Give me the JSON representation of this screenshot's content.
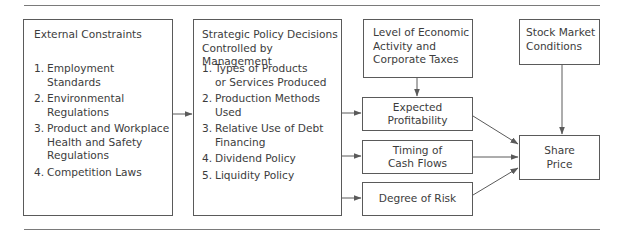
{
  "diagram": {
    "boxes": {
      "external": {
        "title": "External Constraints",
        "items": [
          {
            "num": "1.",
            "text": "Employment Standards",
            "lines": [
              "Employment",
              "Standards"
            ]
          },
          {
            "num": "2.",
            "text": "Environmental Regulations",
            "lines": [
              "Environmental",
              "Regulations"
            ]
          },
          {
            "num": "3.",
            "text": "Product and Workplace Health and Safety Regulations",
            "lines": [
              "Product and Workplace",
              "Health and Safety",
              "Regulations"
            ]
          },
          {
            "num": "4.",
            "text": "Competition Laws",
            "lines": [
              "Competition Laws"
            ]
          }
        ]
      },
      "strategic": {
        "title_lines": [
          "Strategic Policy Decisions",
          "Controlled by Management"
        ],
        "items": [
          {
            "num": "1.",
            "lines": [
              "Types of Products",
              "or Services Produced"
            ]
          },
          {
            "num": "2.",
            "lines": [
              "Production Methods",
              "Used"
            ]
          },
          {
            "num": "3.",
            "lines": [
              "Relative Use of Debt",
              "Financing"
            ]
          },
          {
            "num": "4.",
            "lines": [
              "Dividend Policy"
            ]
          },
          {
            "num": "5.",
            "lines": [
              "Liquidity Policy"
            ]
          }
        ]
      },
      "economic": {
        "lines": [
          "Level of Economic",
          "Activity and",
          "Corporate Taxes"
        ]
      },
      "stock_market": {
        "lines": [
          "Stock Market",
          "Conditions"
        ]
      },
      "expected_profitability": {
        "lines": [
          "Expected",
          "Profitability"
        ]
      },
      "timing_cash_flows": {
        "lines": [
          "Timing of",
          "Cash Flows"
        ]
      },
      "degree_of_risk": {
        "lines": [
          "Degree of Risk"
        ]
      },
      "share_price": {
        "lines": [
          "Share",
          "Price"
        ]
      }
    },
    "edges": [
      {
        "from": "external",
        "to": "strategic"
      },
      {
        "from": "strategic",
        "to": "expected_profitability"
      },
      {
        "from": "strategic",
        "to": "timing_cash_flows"
      },
      {
        "from": "strategic",
        "to": "degree_of_risk"
      },
      {
        "from": "economic",
        "to": "expected_profitability"
      },
      {
        "from": "expected_profitability",
        "to": "share_price"
      },
      {
        "from": "timing_cash_flows",
        "to": "share_price"
      },
      {
        "from": "degree_of_risk",
        "to": "share_price"
      },
      {
        "from": "stock_market",
        "to": "share_price"
      }
    ],
    "colors": {
      "line": "#5a5a5a",
      "text": "#3c3c3c",
      "rule": "#7a7a7a"
    }
  }
}
